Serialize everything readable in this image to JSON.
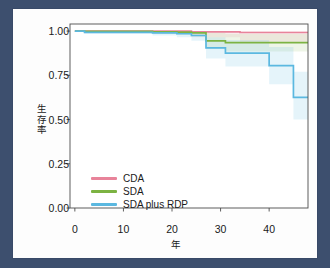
{
  "figure": {
    "background": "#fdfdfd",
    "frame_color": "#3d4f6e",
    "axis_color": "#4d4d4d"
  },
  "chart_data": {
    "type": "line",
    "subtype": "kaplan-meier-step",
    "title": "",
    "xlabel": "年",
    "ylabel": "生存率",
    "xlim": [
      -1,
      48
    ],
    "ylim": [
      0.0,
      1.04
    ],
    "grid": false,
    "legend_position": "lower-left",
    "xticks": [
      0,
      10,
      20,
      30,
      40
    ],
    "xtick_labels": [
      "0",
      "10",
      "20",
      "30",
      "40"
    ],
    "yticks": [
      0.0,
      0.25,
      0.5,
      0.75,
      1.0
    ],
    "ytick_labels": [
      "0.00",
      "0.25",
      "0.50",
      "0.75",
      "1.00"
    ],
    "series": [
      {
        "name": "CDA",
        "color": "#e8839a",
        "band_color": "#e8839a",
        "band_opacity": 0.13,
        "x": [
          0,
          2,
          15,
          21,
          24,
          34,
          48
        ],
        "y": [
          1.0,
          1.0,
          1.0,
          1.0,
          0.995,
          0.992,
          0.992
        ],
        "band_lower": [
          1.0,
          0.995,
          0.99,
          0.985,
          0.965,
          0.94,
          0.93
        ],
        "band_upper": [
          1.0,
          1.0,
          1.0,
          1.0,
          1.0,
          1.0,
          1.0
        ]
      },
      {
        "name": "SDA",
        "color": "#7cb342",
        "band_color": "#7cb342",
        "band_opacity": 0.13,
        "x": [
          0,
          2,
          16,
          21,
          24,
          27,
          31,
          48
        ],
        "y": [
          1.0,
          0.998,
          0.996,
          0.994,
          0.99,
          0.945,
          0.935,
          0.935
        ],
        "band_lower": [
          1.0,
          0.99,
          0.985,
          0.98,
          0.97,
          0.9,
          0.885,
          0.875
        ],
        "band_upper": [
          1.0,
          1.0,
          1.0,
          1.0,
          1.0,
          0.99,
          0.985,
          0.985
        ]
      },
      {
        "name": "SDA plus RDP",
        "color": "#5bb8e0",
        "band_color": "#5bb8e0",
        "band_opacity": 0.16,
        "x": [
          0,
          2,
          16,
          21,
          24,
          27,
          31,
          40,
          45,
          48
        ],
        "y": [
          1.0,
          0.993,
          0.99,
          0.985,
          0.975,
          0.905,
          0.875,
          0.805,
          0.625,
          0.625
        ],
        "band_lower": [
          1.0,
          0.985,
          0.975,
          0.965,
          0.945,
          0.845,
          0.8,
          0.7,
          0.5,
          0.5
        ],
        "band_upper": [
          1.0,
          1.0,
          1.0,
          1.0,
          1.0,
          0.965,
          0.95,
          0.91,
          0.77,
          0.77
        ]
      }
    ]
  },
  "legend": {
    "entries": [
      {
        "label": "CDA",
        "color": "#e8839a"
      },
      {
        "label": "SDA",
        "color": "#7cb342"
      },
      {
        "label": "SDA plus RDP",
        "color": "#5bb8e0"
      }
    ]
  },
  "axis_label_y_chars": [
    "生",
    "存",
    "率"
  ]
}
